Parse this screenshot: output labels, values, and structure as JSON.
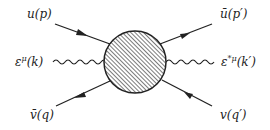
{
  "diagram": {
    "type": "feynman",
    "title": "",
    "blob": {
      "name": "interaction-blob",
      "fill": "hatched"
    },
    "lines": [
      {
        "id": "in-fermion-top-left",
        "kind": "fermion",
        "label": "u(p)",
        "direction": "incoming"
      },
      {
        "id": "out-fermion-top-right",
        "kind": "fermion",
        "label": "ū(p′)",
        "direction": "outgoing"
      },
      {
        "id": "in-photon-left",
        "kind": "photon",
        "label": "ε^μ(k)",
        "direction": "incoming"
      },
      {
        "id": "out-photon-right",
        "kind": "photon",
        "label": "ε^{*μ}(k′)",
        "direction": "outgoing"
      },
      {
        "id": "in-antifermion-bottom-left",
        "kind": "fermion",
        "label": "v̄(q)",
        "direction": "incoming"
      },
      {
        "id": "out-antifermion-bottom-right",
        "kind": "fermion",
        "label": "v(q′)",
        "direction": "outgoing"
      }
    ],
    "labels": {
      "top_left": "u(p)",
      "top_right_base": "ū(p",
      "top_right_prime": "′)",
      "left_eps": "ε",
      "left_sup": "μ",
      "left_arg": "(k)",
      "right_eps": "ε",
      "right_sup": "*μ",
      "right_arg": "(k′)",
      "bottom_left": "v̄(q)",
      "bottom_right": "v(q′)"
    },
    "colors": {
      "line": "#222222",
      "background": "#ffffff"
    }
  }
}
